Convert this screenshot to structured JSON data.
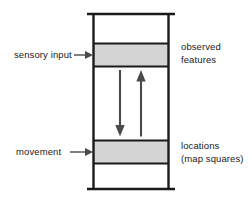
{
  "figure": {
    "type": "diagram",
    "colors": {
      "stroke": "#1a1a1a",
      "band_fill": "#d4d4d4",
      "background": "#ffffff",
      "text": "#1a1a1a"
    }
  },
  "labels": {
    "left": [
      {
        "name": "sensory-input",
        "text": "sensory input",
        "arrow": "arrow-right-icon",
        "points_to": "observed-features-band"
      },
      {
        "name": "movement",
        "text": "movement",
        "arrow": "arrow-right-icon",
        "points_to": "locations-band"
      }
    ],
    "right": [
      {
        "name": "observed-features",
        "line1": "observed",
        "line2": "features"
      },
      {
        "name": "locations",
        "line1": "locations",
        "line2": "(map squares)"
      }
    ]
  },
  "bands": [
    {
      "name": "observed-features-band",
      "fill": "#d4d4d4",
      "y_top": 43,
      "y_bottom": 66
    },
    {
      "name": "locations-band",
      "fill": "#d4d4d4",
      "y_top": 140,
      "y_bottom": 163
    }
  ],
  "arrows": [
    {
      "name": "downward-arrow",
      "direction": "down",
      "x": 120,
      "y_start": 70,
      "y_end": 136
    },
    {
      "name": "upward-arrow",
      "direction": "up",
      "x": 141,
      "y_start": 136,
      "y_end": 70
    }
  ],
  "column": {
    "name": "column-outline",
    "left": 93,
    "right": 169,
    "top": 14,
    "bottom": 189,
    "cap_left": 87,
    "cap_right": 175
  }
}
